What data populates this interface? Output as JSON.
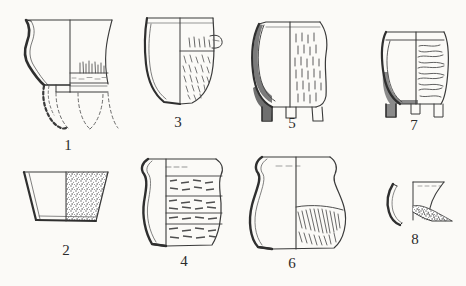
{
  "plate": {
    "title": "Pottery typology plate",
    "description": "Archaeological line drawings of eight ceramic vessel profiles, each numbered",
    "background_color": "#fbfaf7",
    "ink_color": "#3a3a3a",
    "shading_color": "#8a8a8a",
    "vessel_count": 8,
    "rows": 2,
    "columns": 4
  },
  "vessels": [
    {
      "number": "1",
      "name": "flared-rim tripod beaker",
      "label_x": 68,
      "label_y": 138,
      "row": 1,
      "column": 1,
      "form": "S-profile beaker with everted flaring rim and reconstructed tripod legs",
      "decoration": "short vertical incised strokes in band above base",
      "reconstruction": "dashed outline for missing legs and lower body",
      "shaded": true
    },
    {
      "number": "2",
      "name": "truncated-cone bowl",
      "label_x": 66,
      "label_y": 243,
      "row": 2,
      "column": 1,
      "form": "open bowl with straight flaring walls and flat base",
      "decoration": "dense stippled / speckled surface texture on right half",
      "reconstruction": "none",
      "shaded": false
    },
    {
      "number": "3",
      "name": "deep bucket-shaped vessel",
      "label_x": 178,
      "label_y": 115,
      "row": 1,
      "column": 2,
      "form": "deep vessel with slightly everted rim and rounded base",
      "decoration": "short oblique incised strokes on right half",
      "reconstruction": "none",
      "shaded": true
    },
    {
      "number": "4",
      "name": "banded ovoid jar",
      "label_x": 184,
      "label_y": 254,
      "row": 2,
      "column": 2,
      "form": "tall ovoid jar with everted rim and narrow flat base",
      "decoration": "four horizontal bands of dashed impressed decoration",
      "reconstruction": "none",
      "shaded": true
    },
    {
      "number": "5",
      "name": "tripod cooking pot",
      "label_x": 292,
      "label_y": 116,
      "row": 1,
      "column": 3,
      "form": "bag-shaped tripod pot with three short conical feet",
      "decoration": "short vertical incised strokes over right half",
      "reconstruction": "none",
      "shaded": true
    },
    {
      "number": "6",
      "name": "globular necked jar",
      "label_x": 292,
      "label_y": 256,
      "row": 2,
      "column": 3,
      "form": "globular jar with short cylindrical neck and flaring rim",
      "decoration": "diagonal combed hatching across lower body",
      "reconstruction": "none",
      "shaded": true
    },
    {
      "number": "7",
      "name": "squat tripod jar",
      "label_x": 414,
      "label_y": 118,
      "row": 1,
      "column": 4,
      "form": "squat barrel-bodied tripod jar with everted rim",
      "decoration": "horizontal wavy combed lines over right half",
      "reconstruction": "none",
      "shaded": true
    },
    {
      "number": "8",
      "name": "rim and wall sherd",
      "label_x": 415,
      "label_y": 232,
      "row": 2,
      "column": 4,
      "form": "fragmentary neck sherd with separate curved wall fragment at left",
      "decoration": "hatched break surface at base of neck",
      "reconstruction": "partial profile only",
      "shaded": true
    }
  ]
}
